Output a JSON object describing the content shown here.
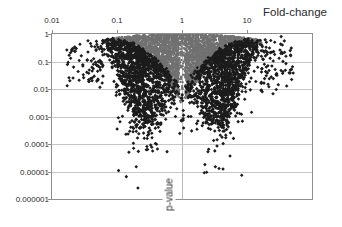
{
  "window": {
    "width": 342,
    "height": 227,
    "background": "#ffffff"
  },
  "colors": {
    "background": "#ffffff",
    "grid": "#c6c6c6",
    "center_gridline": "#b9b9b9",
    "axis_border": "#8f8f8f",
    "text": "#2b2b2b",
    "gray_points": "#717171",
    "black_points": "#1c1c1c"
  },
  "chart_data": {
    "type": "scatter",
    "title": "Fold-change",
    "xlabel": "Fold-change",
    "ylabel": "p-value",
    "x_scale": "log",
    "y_scale": "log",
    "xlim": [
      0.01,
      100
    ],
    "ylim": [
      1e-06,
      1
    ],
    "x_tick_labels": [
      "0.01",
      "0.1",
      "1",
      "10"
    ],
    "x_tick_values": [
      0.01,
      0.1,
      1,
      10
    ],
    "y_tick_labels": [
      "1",
      "0.1",
      "0.01",
      "0.001",
      "0.0001",
      "0.00001",
      "0.000001"
    ],
    "y_tick_values": [
      1,
      0.1,
      0.01,
      0.001,
      0.0001,
      1e-05,
      1e-06
    ],
    "grid": {
      "horizontal_every_decade": true,
      "vertical_only_at_fold_change_1": true
    },
    "legend": "none",
    "series": [
      {
        "name": "non-significant-cloud",
        "marker": "square",
        "size_px": 2,
        "color": "#717171",
        "description": "Dense grey cloud forming two dome-shaped lobes flanking fold-change = 1; tops touch p = 1, tapering outward to fold-change ~0.06 and ~16 and downward to p ~0.004 near the centre; a narrow grey column sits on the fold-change = 1 line down to p ~0.003."
      },
      {
        "name": "significant-points",
        "marker": "diamond",
        "size_px": 3,
        "color": "#1c1c1c",
        "description": "Black points forming dense crescents beneath and outside the grey lobes: fold-change ~0.02-0.6 (left) and ~1.6-30 (right), p from ~0.5 down to ~0.001 densely, scattering down to ~2e-6."
      }
    ],
    "notable_outliers": [
      {
        "fc": 0.21,
        "p": 2.5e-06
      },
      {
        "fc": 0.18,
        "p": 7e-05
      },
      {
        "fc": 0.148,
        "p": 0.00023
      },
      {
        "fc": 0.105,
        "p": 0.0009
      },
      {
        "fc": 2.2,
        "p": 9e-06
      },
      {
        "fc": 3.2,
        "p": 5.6e-05
      },
      {
        "fc": 4.9,
        "p": 0.00074
      },
      {
        "fc": 6.2,
        "p": 0.00016
      }
    ],
    "generation": {
      "seed": 77,
      "gray_per_lobe": 1600,
      "gray_center_column": 80,
      "black_dense_per_lobe": 1150,
      "black_below_per_lobe": 130,
      "black_deep_per_lobe": 15,
      "black_outer_per_lobe": 85,
      "black_center_column": 12,
      "lobe": {
        "top_coef": 6,
        "top_pow": 2.5,
        "thick_base": 3,
        "thick_coef": 62,
        "thick_pow": 2,
        "black_top_frac": 0.78,
        "black_depth_base": 14,
        "black_depth_coef": 55,
        "black_depth_pow": 1.4,
        "outer_reach_left": 37,
        "outer_reach_right": 34
      }
    }
  }
}
